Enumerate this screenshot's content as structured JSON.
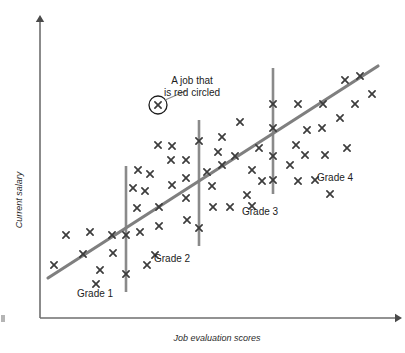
{
  "chart_data": {
    "type": "scatter",
    "title": "",
    "subtitle": "",
    "xlabel": "Job evaluation scores",
    "ylabel": "Current salary",
    "xlim": [
      0,
      100
    ],
    "ylim": [
      0,
      100
    ],
    "grid": false,
    "legend": "none",
    "axes": {
      "x_axis": {
        "x1": 40,
        "y1": 318,
        "x2": 395,
        "y2": 318,
        "arrow": "right"
      },
      "y_axis": {
        "x1": 40,
        "y1": 318,
        "x2": 40,
        "y2": 22,
        "arrow": "up"
      },
      "ticks": [],
      "tick_labels": []
    },
    "series": [
      {
        "name": "Jobs",
        "marker": "x",
        "color": "#3c3c3c",
        "points": [
          [
            66,
            235
          ],
          [
            90,
            232
          ],
          [
            54,
            265
          ],
          [
            83,
            254
          ],
          [
            96,
            284
          ],
          [
            113,
            253
          ],
          [
            112,
            235
          ],
          [
            126,
            235
          ],
          [
            126,
            274
          ],
          [
            100,
            270
          ],
          [
            140,
            232
          ],
          [
            147,
            265
          ],
          [
            155,
            255
          ],
          [
            159,
            226
          ],
          [
            137,
            208
          ],
          [
            159,
            207
          ],
          [
            145,
            191
          ],
          [
            172,
            185
          ],
          [
            133,
            188
          ],
          [
            138,
            170
          ],
          [
            150,
            174
          ],
          [
            171,
            160
          ],
          [
            158,
            145
          ],
          [
            172,
            146
          ],
          [
            187,
            220
          ],
          [
            199,
            228
          ],
          [
            199,
            141
          ],
          [
            186,
            198
          ],
          [
            186,
            178
          ],
          [
            186,
            160
          ],
          [
            207,
            172
          ],
          [
            212,
            186
          ],
          [
            213,
            207
          ],
          [
            222,
            165
          ],
          [
            230,
            207
          ],
          [
            218,
            152
          ],
          [
            222,
            137
          ],
          [
            240,
            122
          ],
          [
            235,
            156
          ],
          [
            247,
            195
          ],
          [
            252,
            170
          ],
          [
            252,
            206
          ],
          [
            259,
            148
          ],
          [
            262,
            181
          ],
          [
            273,
            104
          ],
          [
            273,
            128
          ],
          [
            273,
            156
          ],
          [
            273,
            180
          ],
          [
            290,
            165
          ],
          [
            296,
            145
          ],
          [
            298,
            181
          ],
          [
            298,
            104
          ],
          [
            305,
            155
          ],
          [
            307,
            130
          ],
          [
            315,
            180
          ],
          [
            323,
            104
          ],
          [
            322,
            128
          ],
          [
            325,
            155
          ],
          [
            330,
            194
          ],
          [
            340,
            118
          ],
          [
            345,
            80
          ],
          [
            347,
            148
          ],
          [
            355,
            104
          ],
          [
            360,
            76
          ],
          [
            372,
            94
          ],
          [
            158,
            105
          ]
        ]
      }
    ],
    "trend_line": {
      "label": "regression line",
      "x1": 48,
      "y1": 278,
      "x2": 378,
      "y2": 66,
      "color": "#7f7f7f"
    },
    "grade_dividers": [
      {
        "label": "Grade 1",
        "x": 126,
        "y_top": 166,
        "y_bottom": 292,
        "color": "#8a8a8a"
      },
      {
        "label": "Grade 2",
        "x": 199,
        "y_top": 120,
        "y_bottom": 246,
        "color": "#8a8a8a"
      },
      {
        "label": "Grade 3",
        "x": 273,
        "y_top": 68,
        "y_bottom": 194,
        "color": "#8a8a8a"
      }
    ],
    "grade_labels": [
      {
        "text": "Grade 1",
        "x": 77,
        "y": 297
      },
      {
        "text": "Grade 2",
        "x": 154,
        "y": 262
      },
      {
        "text": "Grade 3",
        "x": 242,
        "y": 215
      },
      {
        "text": "Grade 4",
        "x": 317,
        "y": 181
      }
    ],
    "annotation": {
      "lines": [
        "A job that",
        "is red circled"
      ],
      "text_x": 192,
      "text_y": 84,
      "circle": {
        "cx": 158,
        "cy": 105,
        "r": 9,
        "color": "#1c1c1c"
      },
      "leader": {
        "x1": 186,
        "y1": 91,
        "x2": 165,
        "y2": 100,
        "color": "#8a8a8a"
      }
    },
    "colors": {
      "background": "#ffffff",
      "axis": "#6e6e6e",
      "marker": "#3c3c3c",
      "trend": "#7f7f7f",
      "divider": "#8a8a8a",
      "text": "#1c1c1c"
    }
  }
}
